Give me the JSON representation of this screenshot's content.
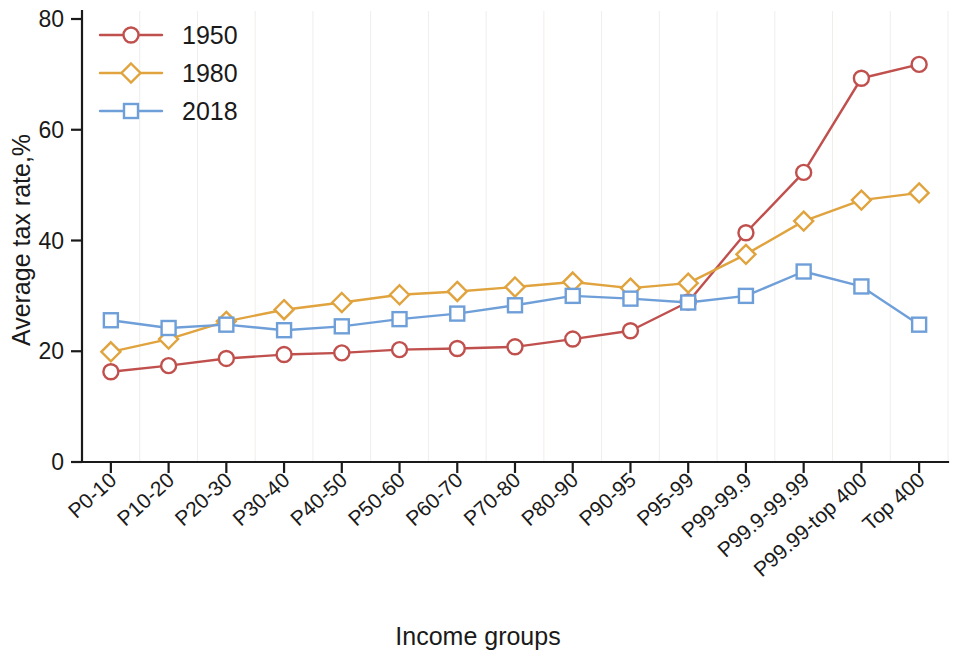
{
  "chart_data": {
    "type": "line",
    "title": "",
    "xlabel": "Income groups",
    "ylabel": "Average tax rate,%",
    "ylim": [
      0,
      80
    ],
    "yticks": [
      0,
      20,
      40,
      60,
      80
    ],
    "grid": false,
    "legend_position": "top-left",
    "categories": [
      "P0-10",
      "P10-20",
      "P20-30",
      "P30-40",
      "P40-50",
      "P50-60",
      "P60-70",
      "P70-80",
      "P80-90",
      "P90-95",
      "P95-99",
      "P99-99.9",
      "P99.9-99.99",
      "P99.99-top 400",
      "Top 400"
    ],
    "series": [
      {
        "name": "1950",
        "color": "#c0504d",
        "marker": "circle",
        "values": [
          16.3,
          17.4,
          18.7,
          19.4,
          19.7,
          20.3,
          20.5,
          20.8,
          22.2,
          23.7,
          28.9,
          41.4,
          52.3,
          69.3,
          71.8
        ]
      },
      {
        "name": "1980",
        "color": "#e0a33e",
        "marker": "diamond",
        "values": [
          19.9,
          22.2,
          25.4,
          27.5,
          28.8,
          30.2,
          30.8,
          31.6,
          32.5,
          31.4,
          32.3,
          37.5,
          43.5,
          47.3,
          48.6
        ]
      },
      {
        "name": "2018",
        "color": "#6f9fd8",
        "marker": "square",
        "values": [
          25.6,
          24.2,
          24.8,
          23.8,
          24.5,
          25.8,
          26.8,
          28.3,
          30.0,
          29.5,
          28.8,
          30.0,
          34.4,
          31.7,
          24.8
        ]
      }
    ]
  },
  "legend": {
    "entries": [
      {
        "label": "1950"
      },
      {
        "label": "1980"
      },
      {
        "label": "2018"
      }
    ]
  },
  "axes": {
    "y_title": "Average tax rate,%",
    "x_title": "Income groups",
    "y_tick_labels": [
      "0",
      "20",
      "40",
      "60",
      "80"
    ]
  }
}
